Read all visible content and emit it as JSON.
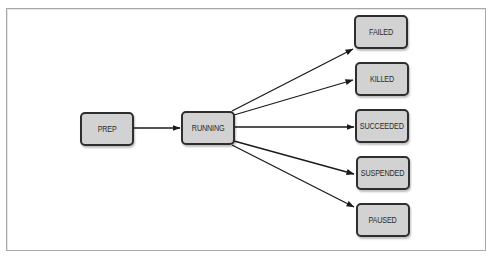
{
  "diagram": {
    "type": "state-transition",
    "colors": {
      "node_fill": "#d2d2d2",
      "node_border": "#2e2e2e",
      "edge": "#1a1a1a",
      "frame_border": "#a8a8a8"
    },
    "nodes": [
      {
        "id": "prep",
        "label": "PREP"
      },
      {
        "id": "running",
        "label": "RUNNING"
      },
      {
        "id": "failed",
        "label": "FAILED"
      },
      {
        "id": "killed",
        "label": "KILLED"
      },
      {
        "id": "succeeded",
        "label": "SUCCEEDED"
      },
      {
        "id": "suspended",
        "label": "SUSPENDED"
      },
      {
        "id": "paused",
        "label": "PAUSED"
      }
    ],
    "edges": [
      {
        "from": "PREP",
        "to": "RUNNING"
      },
      {
        "from": "RUNNING",
        "to": "FAILED"
      },
      {
        "from": "RUNNING",
        "to": "KILLED"
      },
      {
        "from": "RUNNING",
        "to": "SUCCEEDED"
      },
      {
        "from": "RUNNING",
        "to": "SUSPENDED"
      },
      {
        "from": "RUNNING",
        "to": "PAUSED"
      }
    ]
  }
}
